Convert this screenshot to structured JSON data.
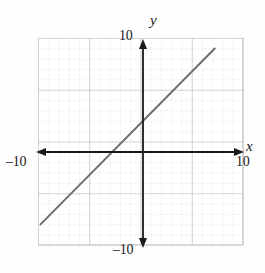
{
  "figure": {
    "kind": "coordinate-plane-graph",
    "background_color": "#fefefe"
  },
  "labels": {
    "x_axis": "x",
    "y_axis": "y",
    "x_min_tick": "–10",
    "x_max_tick": "10",
    "y_min_tick": "–10",
    "y_max_tick": "10"
  },
  "colors": {
    "axis": "#1a1a1a",
    "line": "#6b6b6b",
    "grid_minor": "#c9c9c9",
    "grid_major": "#b0b0b0",
    "text": "#1a1a1a"
  },
  "chart_data": {
    "type": "line",
    "title": "",
    "xlabel": "x",
    "ylabel": "y",
    "xlim": [
      -10,
      10
    ],
    "ylim": [
      -10,
      10
    ],
    "xticks": [
      -10,
      10
    ],
    "yticks": [
      -10,
      10
    ],
    "grid": true,
    "grid_step_minor": 1,
    "grid_step_major": 5,
    "legend": "none",
    "series": [
      {
        "name": "line",
        "slope": 1,
        "y_intercept": 3,
        "x_intercept": -3,
        "equation": "y = x + 3",
        "x": [
          -10,
          -3,
          0,
          7
        ],
        "y": [
          -7,
          0,
          3,
          10
        ],
        "endpoints": [
          {
            "x": -10,
            "y": -7
          },
          {
            "x": 7,
            "y": 10
          }
        ]
      }
    ],
    "annotations": []
  },
  "geometry": {
    "plot_left": 38,
    "plot_top": 38,
    "plot_right": 243,
    "plot_bottom": 245,
    "origin_x": 143,
    "origin_y": 152,
    "unit_px_x": 10.25,
    "unit_px_y": 10.35
  }
}
